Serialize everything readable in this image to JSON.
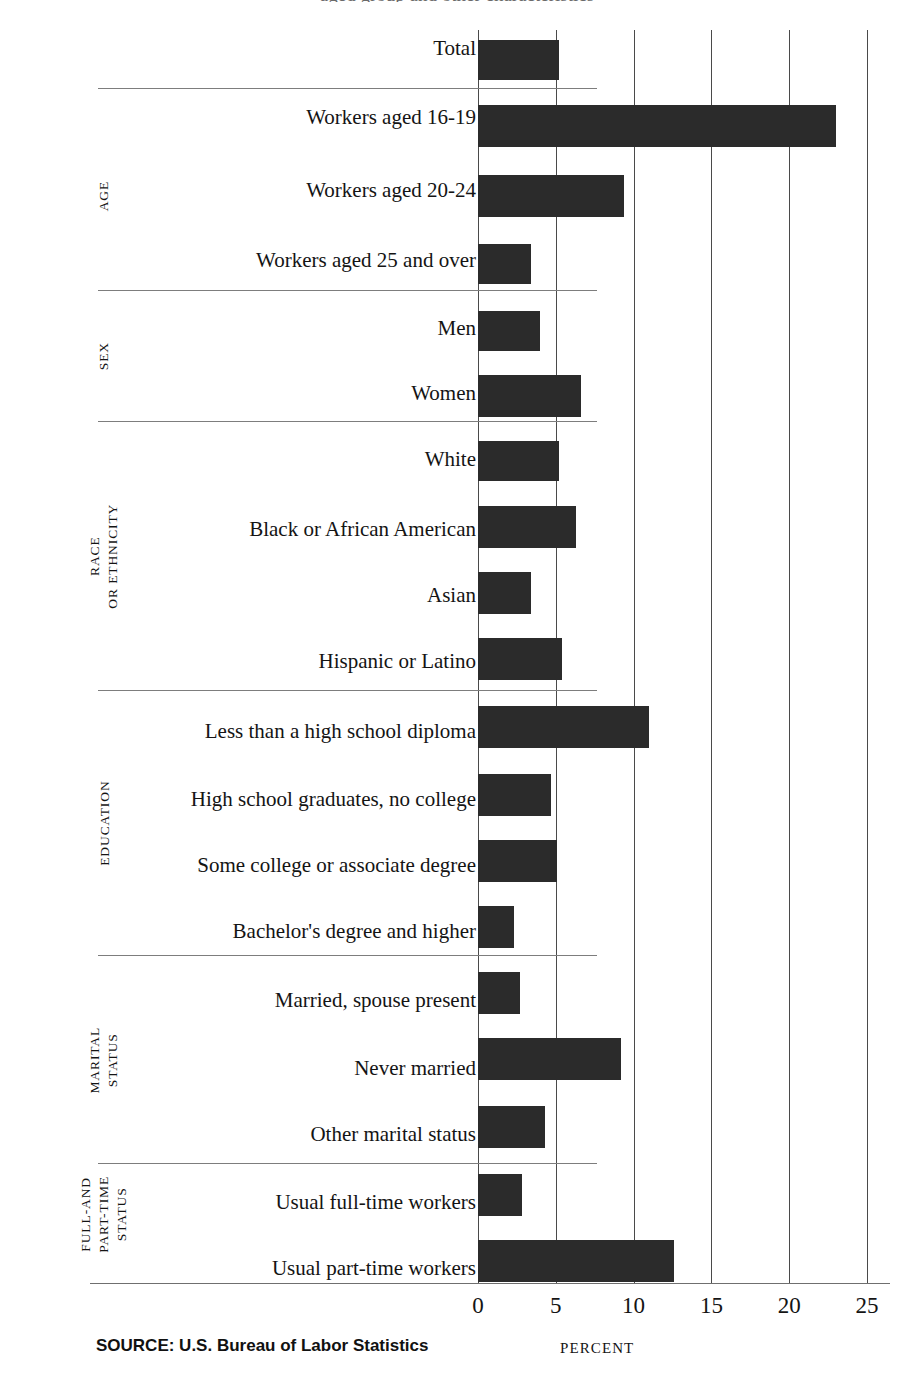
{
  "figure": {
    "title_partial": "aged group and other characteristics",
    "source_note": "SOURCE: U.S. Bureau of Labor Statistics",
    "axis_title": "PERCENT"
  },
  "chart_data": {
    "type": "bar",
    "orientation": "horizontal",
    "title": "",
    "xlabel": "PERCENT",
    "ylabel": "",
    "xlim": [
      0,
      25
    ],
    "xticks": [
      0,
      5,
      10,
      15,
      20,
      25
    ],
    "xtick_labels": [
      "0",
      "5",
      "10",
      "15",
      "20",
      "25"
    ],
    "grid": "vertical",
    "legend": "none",
    "bar_color": "#2b2b2b",
    "categories": [
      "Total",
      "Workers aged 16-19",
      "Workers aged 20-24",
      "Workers aged 25 and over",
      "Men",
      "Women",
      "White",
      "Black or African American",
      "Asian",
      "Hispanic or Latino",
      "Less than a high school diploma",
      "High school graduates, no college",
      "Some college or associate degree",
      "Bachelor's degree and higher",
      "Married, spouse present",
      "Never married",
      "Other marital status",
      "Usual full-time workers",
      "Usual part-time workers"
    ],
    "values": [
      5.2,
      23.0,
      9.4,
      3.4,
      4.0,
      6.6,
      5.2,
      6.3,
      3.4,
      5.4,
      11.0,
      4.7,
      5.1,
      2.3,
      2.7,
      9.2,
      4.3,
      2.8,
      12.6
    ],
    "groups": [
      {
        "label_lines": [
          ""
        ],
        "count": 1
      },
      {
        "label_lines": [
          "AGE"
        ],
        "count": 3
      },
      {
        "label_lines": [
          "SEX"
        ],
        "count": 2
      },
      {
        "label_lines": [
          "RACE",
          "OR ETHNICITY"
        ],
        "count": 4
      },
      {
        "label_lines": [
          "EDUCATION"
        ],
        "count": 4
      },
      {
        "label_lines": [
          "MARITAL",
          "STATUS"
        ],
        "count": 3
      },
      {
        "label_lines": [
          "FULL-AND",
          "PART-TIME",
          "STATUS"
        ],
        "count": 2
      }
    ]
  },
  "rows": [
    {
      "label": "Total",
      "value": 5.2,
      "top": 38,
      "bar_top": 40,
      "bar_h": 40
    },
    {
      "label": "Workers aged 16-19",
      "value": 23.0,
      "top": 107,
      "bar_top": 105,
      "bar_h": 42
    },
    {
      "label": "Workers aged 20-24",
      "value": 9.4,
      "top": 180,
      "bar_top": 175,
      "bar_h": 42
    },
    {
      "label": "Workers aged 25 and over",
      "value": 3.4,
      "top": 250,
      "bar_top": 244,
      "bar_h": 40
    },
    {
      "label": "Men",
      "value": 4.0,
      "top": 318,
      "bar_top": 311,
      "bar_h": 40
    },
    {
      "label": "Women",
      "value": 6.6,
      "top": 383,
      "bar_top": 375,
      "bar_h": 42
    },
    {
      "label": "White",
      "value": 5.2,
      "top": 449,
      "bar_top": 441,
      "bar_h": 40
    },
    {
      "label": "Black or African American",
      "value": 6.3,
      "top": 519,
      "bar_top": 506,
      "bar_h": 42
    },
    {
      "label": "Asian",
      "value": 3.4,
      "top": 585,
      "bar_top": 572,
      "bar_h": 42
    },
    {
      "label": "Hispanic or Latino",
      "value": 5.4,
      "top": 651,
      "bar_top": 638,
      "bar_h": 42
    },
    {
      "label": "Less than a high school diploma",
      "value": 11.0,
      "top": 721,
      "bar_top": 706,
      "bar_h": 42
    },
    {
      "label": "High school graduates, no college",
      "value": 4.7,
      "top": 789,
      "bar_top": 774,
      "bar_h": 42
    },
    {
      "label": "Some college or associate degree",
      "value": 5.1,
      "top": 855,
      "bar_top": 840,
      "bar_h": 42
    },
    {
      "label": "Bachelor's degree and higher",
      "value": 2.3,
      "top": 921,
      "bar_top": 906,
      "bar_h": 42
    },
    {
      "label": "Married, spouse present",
      "value": 2.7,
      "top": 990,
      "bar_top": 972,
      "bar_h": 42
    },
    {
      "label": "Never married",
      "value": 9.2,
      "top": 1058,
      "bar_top": 1038,
      "bar_h": 42
    },
    {
      "label": "Other marital status",
      "value": 4.3,
      "top": 1124,
      "bar_top": 1106,
      "bar_h": 42
    },
    {
      "label": "Usual full-time workers",
      "value": 2.8,
      "top": 1192,
      "bar_top": 1174,
      "bar_h": 42
    },
    {
      "label": "Usual part-time workers",
      "value": 12.6,
      "top": 1258,
      "bar_top": 1240,
      "bar_h": 42
    }
  ],
  "ticks": [
    {
      "label": "0",
      "value": 0
    },
    {
      "label": "5",
      "value": 5
    },
    {
      "label": "10",
      "value": 10
    },
    {
      "label": "15",
      "value": 15
    },
    {
      "label": "20",
      "value": 20
    },
    {
      "label": "25",
      "value": 25
    }
  ],
  "separators_y": [
    88,
    290,
    421,
    690,
    955,
    1163
  ],
  "group_labels": [
    {
      "lines": [
        "AGE"
      ],
      "cx": 104,
      "cy": 196
    },
    {
      "lines": [
        "SEX"
      ],
      "cx": 104,
      "cy": 356
    },
    {
      "lines": [
        "RACE",
        "OR ETHNICITY"
      ],
      "cx": 104,
      "cy": 556
    },
    {
      "lines": [
        "EDUCATION"
      ],
      "cx": 104,
      "cy": 823
    },
    {
      "lines": [
        "MARITAL",
        "STATUS"
      ],
      "cx": 104,
      "cy": 1060
    },
    {
      "lines": [
        "FULL-AND",
        "PART-TIME",
        "STATUS"
      ],
      "cx": 104,
      "cy": 1214
    }
  ],
  "geometry": {
    "x0_px": 478,
    "px_per_unit": 15.56,
    "plot_top": 30,
    "plot_bottom": 1283
  }
}
